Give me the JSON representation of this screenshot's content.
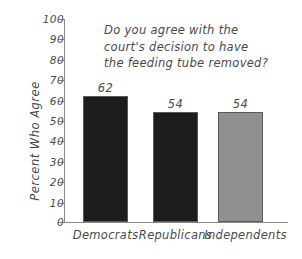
{
  "chart_data": {
    "type": "bar",
    "title": "",
    "annotation": "Do you agree with the court's decision to have the feeding tube removed?",
    "annotation_lines": [
      "Do you agree with the",
      "court's decision to have",
      "the feeding tube removed?"
    ],
    "categories": [
      "Democrats",
      "Republicans",
      "Independents"
    ],
    "values": [
      62,
      54,
      54
    ],
    "value_labels": [
      "62",
      "54",
      "54"
    ],
    "xlabel": "",
    "ylabel": "Percent Who Agree",
    "ylim": [
      0,
      100
    ],
    "ytick_labels": [
      "100",
      "90",
      "80",
      "70",
      "60",
      "50",
      "40",
      "30",
      "20",
      "10",
      "0"
    ],
    "ytick_values": [
      100,
      90,
      80,
      70,
      60,
      50,
      40,
      30,
      20,
      10,
      0
    ],
    "grid": false,
    "legend": false,
    "bar_colors": [
      "#1d1d1d",
      "#1d1d1d",
      "#909090"
    ],
    "bar_edge_color": "#5a5a5a",
    "axis_color": "#8a8a8a",
    "text_color": "#4a4a4a",
    "background": "#ffffff"
  }
}
